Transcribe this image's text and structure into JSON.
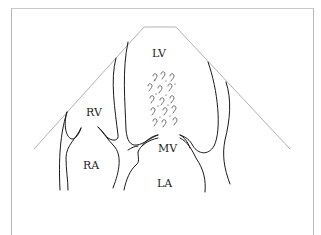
{
  "diagram": {
    "type": "echocardiogram apical four-chamber schematic",
    "labels": {
      "lv": "LV",
      "rv": "RV",
      "ra": "RA",
      "la": "LA",
      "mv": "MV"
    },
    "features": [
      "ultrasound sector outline",
      "chamber walls",
      "turbulent flow swirls above mitral valve"
    ],
    "colors": {
      "background": "#ffffff",
      "frame": "#b8b8b8",
      "sector": "#a8a8a8",
      "ink": "#1a1a1a"
    }
  }
}
